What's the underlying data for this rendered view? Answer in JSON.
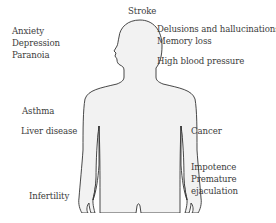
{
  "diagram": {
    "type": "body-effects-diagram",
    "body_fill_color": "#f2f2f2",
    "body_stroke_color": "#333333",
    "labels": {
      "stroke": "Stroke",
      "mental": [
        "Anxiety",
        "Depression",
        "Paranoia"
      ],
      "cognitive": [
        "Delusions and hallucinations",
        "Memory loss"
      ],
      "blood_pressure": "High blood pressure",
      "asthma": "Asthma",
      "liver": "Liver disease",
      "cancer": "Cancer",
      "sexual": [
        "Impotence",
        "Premature",
        "ejaculation"
      ],
      "infertility": "Infertility"
    }
  }
}
